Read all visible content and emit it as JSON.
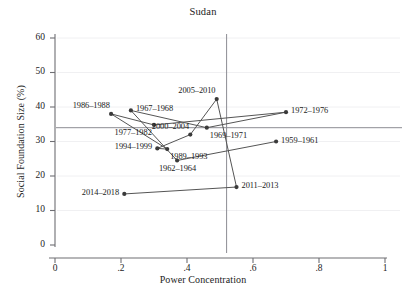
{
  "chart_data": {
    "type": "scatter",
    "title": "Sudan",
    "xlabel": "Power Concentration",
    "ylabel": "Social Foundation Size (%)",
    "xlim": [
      0,
      1.06
    ],
    "ylim": [
      0,
      63
    ],
    "xticks": [
      "0",
      ".2",
      ".4",
      ".6",
      ".8",
      "1"
    ],
    "xtick_values": [
      0,
      0.2,
      0.4,
      0.6,
      0.8,
      1
    ],
    "yticks": [
      "0",
      "10",
      "20",
      "30",
      "40",
      "50",
      "60"
    ],
    "ytick_values": [
      0,
      10,
      20,
      30,
      40,
      50,
      60
    ],
    "grid": false,
    "legend": "none",
    "connected": true,
    "series_name": "Sudan periods",
    "reference_lines": {
      "horizontal_y": 34.0,
      "vertical_x": 0.52
    },
    "marker_color": "#3a3a3a",
    "line_color": "#555555",
    "reference_line_color": "#8d8d93",
    "axis_color": "#6e6e73",
    "points": [
      {
        "label": "1959–1961",
        "x": 0.67,
        "y": 30.0,
        "label_pos": "right"
      },
      {
        "label": "1962–1964",
        "x": 0.37,
        "y": 24.5,
        "label_pos": "below"
      },
      {
        "label": "1967–1968",
        "x": 0.23,
        "y": 39.0,
        "label_pos": "right"
      },
      {
        "label": "1969–1971",
        "x": 0.46,
        "y": 34.0,
        "label_pos": "below-right"
      },
      {
        "label": "1972–1976",
        "x": 0.7,
        "y": 38.5,
        "label_pos": "right"
      },
      {
        "label": "1977–1982",
        "x": 0.3,
        "y": 34.8,
        "label_pos": "below-left"
      },
      {
        "label": "1986–1988",
        "x": 0.17,
        "y": 38.0,
        "label_pos": "above-left"
      },
      {
        "label": "1989–1993",
        "x": 0.34,
        "y": 27.8,
        "label_pos": "below-right"
      },
      {
        "label": "1994–1999",
        "x": 0.31,
        "y": 28.0,
        "label_pos": "left"
      },
      {
        "label": "2000–2004",
        "x": 0.41,
        "y": 32.0,
        "label_pos": "above-left"
      },
      {
        "label": "2005–2010",
        "x": 0.49,
        "y": 42.3,
        "label_pos": "above-left"
      },
      {
        "label": "2011–2013",
        "x": 0.55,
        "y": 16.8,
        "label_pos": "right"
      },
      {
        "label": "2014–2018",
        "x": 0.21,
        "y": 14.8,
        "label_pos": "left"
      }
    ]
  }
}
